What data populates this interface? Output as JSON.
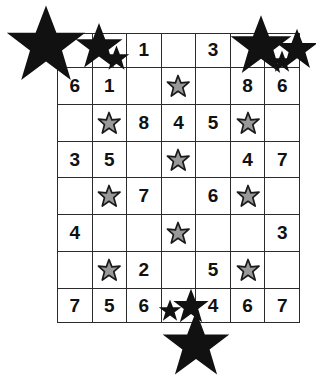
{
  "puzzle": {
    "title": "Star Sudoku Grid",
    "columns": 7,
    "rows": 8,
    "symbols": {
      "gray_star": "gray-star",
      "black_star": "black-star",
      "empty": ""
    },
    "colors": {
      "grid_line": "#2b2b2b",
      "cell_background": "#ffffff",
      "digit": "#111111",
      "gray_star_fill": "#999999",
      "gray_star_outline": "#1a1a1a",
      "black_star_fill": "#111111"
    },
    "cells": [
      [
        "",
        "",
        "1",
        "",
        "3",
        "",
        ""
      ],
      [
        "6",
        "1",
        "",
        "gray-star",
        "",
        "8",
        "6"
      ],
      [
        "",
        "gray-star",
        "8",
        "4",
        "5",
        "gray-star",
        ""
      ],
      [
        "3",
        "5",
        "",
        "gray-star",
        "",
        "4",
        "7"
      ],
      [
        "",
        "gray-star",
        "7",
        "",
        "6",
        "gray-star",
        ""
      ],
      [
        "4",
        "",
        "",
        "gray-star",
        "",
        "",
        "3"
      ],
      [
        "",
        "gray-star",
        "2",
        "",
        "5",
        "gray-star",
        ""
      ],
      [
        "7",
        "5",
        "6",
        "",
        "4",
        "6",
        "7"
      ]
    ]
  },
  "decorations": {
    "top_left_cluster": [
      {
        "name": "black-star-large",
        "size": "large"
      },
      {
        "name": "black-star-medium",
        "size": "medium"
      },
      {
        "name": "black-star-small",
        "size": "small"
      }
    ],
    "top_right_cluster": [
      {
        "name": "black-star-large",
        "size": "large"
      },
      {
        "name": "black-star-medium",
        "size": "medium"
      },
      {
        "name": "black-star-small",
        "size": "small"
      }
    ],
    "bottom_cluster": [
      {
        "name": "black-star-large",
        "size": "large"
      },
      {
        "name": "black-star-medium",
        "size": "medium"
      },
      {
        "name": "black-star-small",
        "size": "small"
      }
    ]
  }
}
